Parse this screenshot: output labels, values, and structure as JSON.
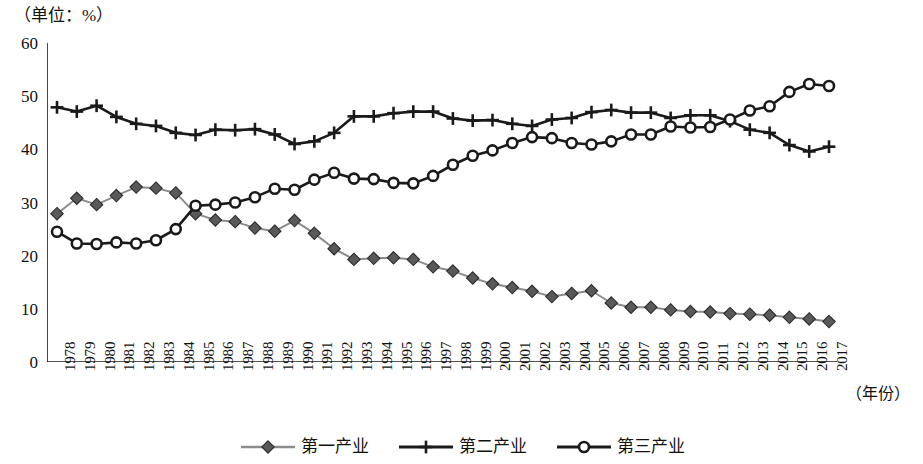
{
  "unit_caption": "（单位：%）",
  "x_axis_title": "（年份）",
  "y_ticks": [
    "0",
    "10",
    "20",
    "30",
    "40",
    "50",
    "60"
  ],
  "legend": {
    "items": [
      {
        "label": "第一产业",
        "marker": "diamond",
        "color": "#595959",
        "line_color": "#8c8c8c"
      },
      {
        "label": "第二产业",
        "marker": "plus",
        "color": "#1a1a1a",
        "line_color": "#1a1a1a"
      },
      {
        "label": "第三产业",
        "marker": "circle",
        "color": "#1a1a1a",
        "line_color": "#1a1a1a"
      }
    ]
  },
  "chart_data": {
    "type": "line",
    "title": "",
    "subtitle": "",
    "xlabel": "（年份）",
    "ylabel": "（单位：%）",
    "ylim": [
      0,
      60
    ],
    "ytick_step": 10,
    "grid": false,
    "legend_position": "bottom",
    "categories": [
      "1978",
      "1979",
      "1980",
      "1981",
      "1982",
      "1983",
      "1984",
      "1985",
      "1986",
      "1987",
      "1988",
      "1989",
      "1990",
      "1991",
      "1992",
      "1993",
      "1994",
      "1995",
      "1996",
      "1997",
      "1998",
      "1999",
      "2000",
      "2001",
      "2002",
      "2003",
      "2004",
      "2005",
      "2006",
      "2007",
      "2008",
      "2009",
      "2010",
      "2011",
      "2012",
      "2013",
      "2014",
      "2015",
      "2016",
      "2017"
    ],
    "series": [
      {
        "name": "第一产业",
        "marker": "diamond",
        "color": "#595959",
        "line_color": "#8c8c8c",
        "values": [
          27.9,
          30.8,
          29.6,
          31.3,
          32.9,
          32.7,
          31.8,
          27.9,
          26.7,
          26.4,
          25.2,
          24.6,
          26.6,
          24.2,
          21.3,
          19.3,
          19.5,
          19.6,
          19.3,
          17.9,
          17.1,
          15.8,
          14.7,
          14.0,
          13.3,
          12.3,
          12.9,
          13.4,
          11.1,
          10.3,
          10.3,
          9.8,
          9.5,
          9.4,
          9.1,
          9.0,
          8.8,
          8.4,
          8.1,
          7.6
        ]
      },
      {
        "name": "第二产业",
        "marker": "plus",
        "color": "#1a1a1a",
        "line_color": "#1a1a1a",
        "values": [
          47.9,
          47.1,
          48.2,
          46.1,
          44.8,
          44.4,
          43.1,
          42.7,
          43.7,
          43.6,
          43.8,
          42.8,
          41.0,
          41.5,
          43.1,
          46.2,
          46.2,
          46.8,
          47.1,
          47.1,
          45.8,
          45.4,
          45.5,
          44.8,
          44.4,
          45.6,
          45.9,
          47.0,
          47.4,
          46.9,
          46.9,
          45.9,
          46.4,
          46.4,
          45.3,
          43.7,
          43.1,
          40.8,
          39.6,
          40.5
        ]
      },
      {
        "name": "第三产业",
        "marker": "circle",
        "color": "#1a1a1a",
        "line_color": "#1a1a1a",
        "values": [
          24.5,
          22.3,
          22.2,
          22.5,
          22.3,
          22.9,
          25.0,
          29.4,
          29.6,
          30.0,
          31.0,
          32.6,
          32.4,
          34.3,
          35.6,
          34.5,
          34.4,
          33.7,
          33.6,
          35.0,
          37.1,
          38.8,
          39.8,
          41.2,
          42.3,
          42.1,
          41.2,
          40.9,
          41.5,
          42.8,
          42.8,
          44.3,
          44.1,
          44.2,
          45.6,
          47.3,
          48.1,
          50.8,
          52.3,
          51.9
        ]
      }
    ]
  }
}
